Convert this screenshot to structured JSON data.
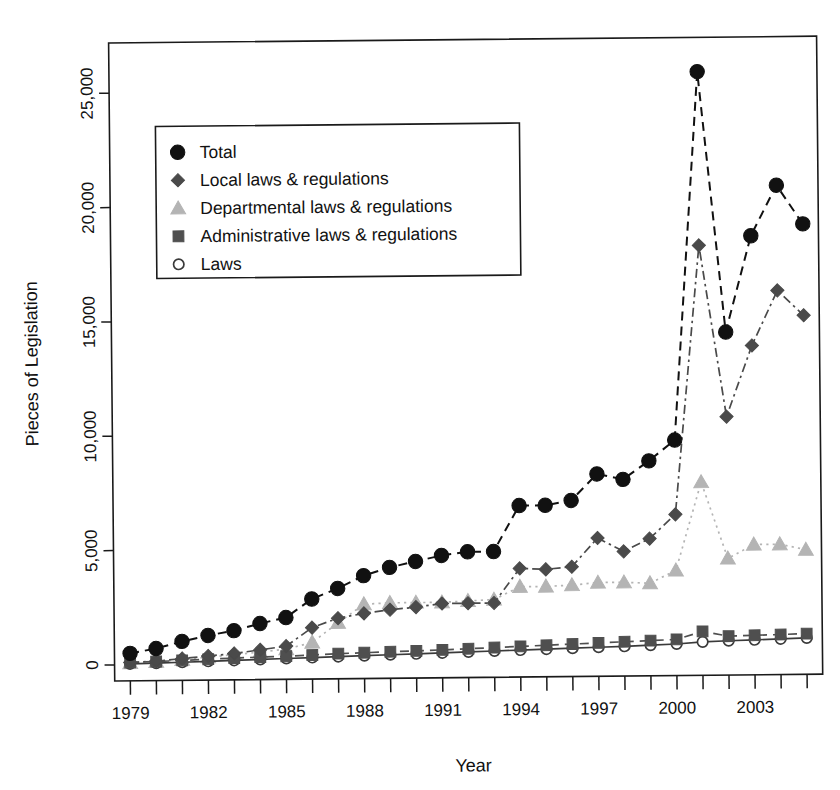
{
  "chart_data": {
    "type": "line",
    "title": "",
    "xlabel": "Year",
    "ylabel": "Pieces of Legislation",
    "xlim": [
      1978.4,
      2005.6
    ],
    "ylim": [
      -700,
      27200
    ],
    "grid": false,
    "legend_position": "upper left",
    "x": [
      1979,
      1980,
      1981,
      1982,
      1983,
      1984,
      1985,
      1986,
      1987,
      1988,
      1989,
      1990,
      1991,
      1992,
      1993,
      1994,
      1995,
      1996,
      1997,
      1998,
      1999,
      2000,
      2001,
      2002,
      2003,
      2004,
      2005
    ],
    "x_tick_labels": [
      "1979",
      "1982",
      "1985",
      "1988",
      "1991",
      "1994",
      "1997",
      "2000",
      "2003"
    ],
    "x_tick_values": [
      1979,
      1982,
      1985,
      1988,
      1991,
      1994,
      1997,
      2000,
      2003
    ],
    "y_tick_labels": [
      "0",
      "5,000",
      "10,000",
      "15,000",
      "20,000",
      "25,000"
    ],
    "y_tick_values": [
      0,
      5000,
      10000,
      15000,
      20000,
      25000
    ],
    "series": [
      {
        "name": "Total",
        "marker": "filled-circle",
        "color": "#111111",
        "linestyle": "dashed",
        "values": [
          500,
          700,
          1000,
          1250,
          1450,
          1750,
          2000,
          2800,
          3250,
          3800,
          4150,
          4400,
          4650,
          4800,
          4800,
          6800,
          6800,
          7000,
          8150,
          7900,
          8700,
          9600,
          25700,
          14300,
          18500,
          20700,
          19000
        ]
      },
      {
        "name": "Local laws & regulations",
        "marker": "filled-diamond",
        "color": "#4a4a4a",
        "linestyle": "dash-dot",
        "values": [
          100,
          150,
          250,
          350,
          450,
          600,
          750,
          1550,
          1950,
          2150,
          2300,
          2400,
          2550,
          2550,
          2550,
          4050,
          4000,
          4100,
          5350,
          4750,
          5300,
          6350,
          18100,
          10600,
          13700,
          16100,
          15000
        ]
      },
      {
        "name": "Departmental laws & regulations",
        "marker": "filled-triangle",
        "color": "#b4b4b4",
        "linestyle": "dotted",
        "values": [
          80,
          120,
          200,
          300,
          400,
          500,
          620,
          900,
          1750,
          2550,
          2600,
          2600,
          2600,
          2650,
          2700,
          3250,
          3250,
          3300,
          3400,
          3400,
          3350,
          3900,
          7750,
          4400,
          5000,
          5000,
          4750
        ]
      },
      {
        "name": "Administrative laws & regulations",
        "marker": "filled-square",
        "color": "#4f4f4f",
        "linestyle": "dashed",
        "values": [
          100,
          130,
          170,
          210,
          250,
          280,
          310,
          350,
          400,
          430,
          460,
          490,
          520,
          560,
          600,
          640,
          680,
          720,
          760,
          800,
          840,
          880,
          1220,
          1000,
          1030,
          1050,
          1080
        ]
      },
      {
        "name": "Laws",
        "marker": "open-circle",
        "color": "#3a3a3a",
        "linestyle": "solid",
        "values": [
          40,
          60,
          90,
          120,
          150,
          180,
          210,
          240,
          270,
          300,
          330,
          360,
          390,
          420,
          450,
          480,
          510,
          540,
          570,
          600,
          640,
          680,
          760,
          800,
          830,
          860,
          890
        ]
      }
    ]
  },
  "axes": {
    "y_title": "Pieces of Legislation",
    "x_title": "Year"
  }
}
